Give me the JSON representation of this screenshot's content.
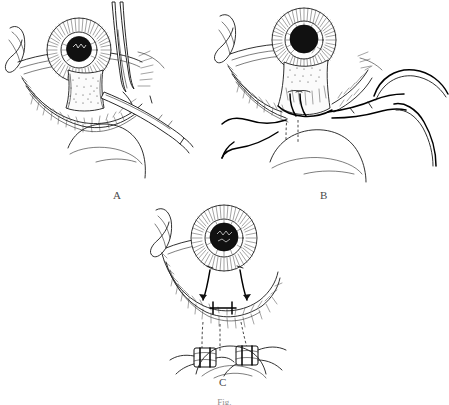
{
  "figure": {
    "kind": "surgical-line-drawing",
    "medium": "pen-and-ink medical illustration",
    "background_color": "#ffffff",
    "ink_color": "#1a1a1a",
    "caption": "Fig.",
    "caption_state": "clipped-at-bottom-edge",
    "panel_labels": {
      "a": "A",
      "b": "B",
      "c": "C"
    },
    "panels": [
      {
        "id": "a",
        "label": "A",
        "step": 1,
        "description": "Eyelid tissue grasped and incised with forceps and scissors",
        "instruments": [
          "scissors",
          "forceps"
        ],
        "features": [
          "globe with radially striated iris and dark pupil",
          "lateral canthus fold",
          "everted lower lid with lash row",
          "stippled tarsal/conjunctival flap",
          "cheek contour below"
        ]
      },
      {
        "id": "b",
        "label": "B",
        "step": 2,
        "description": "Double-armed sutures passed through the tarsal flap and drawn inferiorly",
        "instruments": [
          "curved needle",
          "curved needle"
        ],
        "features": [
          "globe with radially striated iris and dark pupil",
          "mobilized tarsal flap with suture bites",
          "two curved needles with trailing suture threads at right",
          "dashed lines showing suture path beneath tissue",
          "loose suture ends draped at lower left"
        ]
      },
      {
        "id": "c",
        "label": "C",
        "step": 3,
        "description": "Sutures tied over bolsters on the cheek, lid margin reapposed",
        "instruments": [
          "bolster",
          "bolster"
        ],
        "features": [
          "globe with radially striated iris and dark pupil",
          "reapposed lower lid margin with lash row",
          "two arrowed traction sutures at lid margin",
          "dashed suture tracts to the cheek",
          "two rectangular bolsters tied on the cheek"
        ]
      }
    ]
  }
}
